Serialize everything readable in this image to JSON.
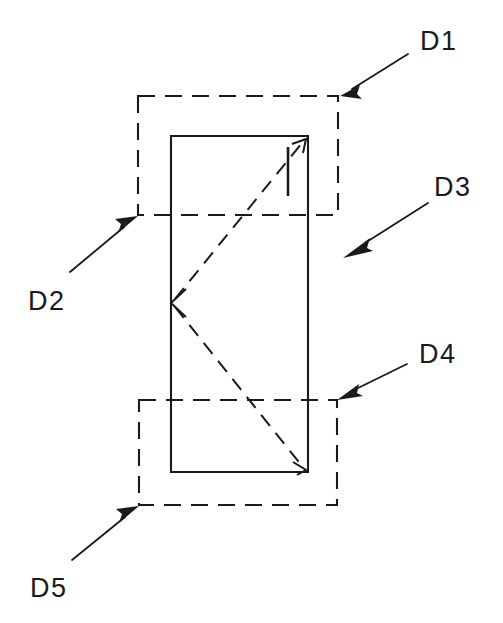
{
  "diagram": {
    "background_color": "#ffffff",
    "line_color": "#1a1a1a",
    "canvas": {
      "width": 503,
      "height": 623
    },
    "labels": [
      {
        "id": "D1",
        "text": "D1",
        "x": 420,
        "y": 50,
        "arrow_tail": {
          "x": 408,
          "y": 54
        },
        "arrow_tip": {
          "x": 340,
          "y": 96
        },
        "points_to": "upper-dashed-rect-top-right-corner"
      },
      {
        "id": "D2",
        "text": "D2",
        "x": 28,
        "y": 310,
        "arrow_tail": {
          "x": 70,
          "y": 272
        },
        "arrow_tip": {
          "x": 138,
          "y": 216
        },
        "points_to": "upper-dashed-rect-bottom-left-corner"
      },
      {
        "id": "D3",
        "text": "D3",
        "x": 434,
        "y": 196,
        "arrow_tail": {
          "x": 428,
          "y": 203
        },
        "arrow_tip": {
          "x": 343,
          "y": 258
        },
        "points_to": "solid-rect-right-side"
      },
      {
        "id": "D4",
        "text": "D4",
        "x": 419,
        "y": 363,
        "arrow_tail": {
          "x": 407,
          "y": 364
        },
        "arrow_tip": {
          "x": 337,
          "y": 400
        },
        "points_to": "lower-dashed-rect-top-right-corner"
      },
      {
        "id": "D5",
        "text": "D5",
        "x": 30,
        "y": 597,
        "arrow_tail": {
          "x": 72,
          "y": 560
        },
        "arrow_tip": {
          "x": 139,
          "y": 506
        },
        "points_to": "lower-dashed-rect-bottom-left-corner"
      }
    ],
    "shapes": {
      "solid_rect": {
        "x1": 171,
        "y1": 136,
        "x2": 308,
        "y2": 472
      },
      "upper_dashed_rect": {
        "x1": 138,
        "y1": 96,
        "x2": 338,
        "y2": 215
      },
      "lower_dashed_rect": {
        "x1": 139,
        "y1": 400,
        "x2": 337,
        "y2": 505
      },
      "diagonal_upper": {
        "x1": 172,
        "y1": 303,
        "x2": 306,
        "y2": 139,
        "arrow_at": "end"
      },
      "diagonal_lower": {
        "x1": 172,
        "y1": 303,
        "x2": 306,
        "y2": 470,
        "arrow_at": "end"
      },
      "vertex_arrow": {
        "x": 172,
        "y": 303,
        "direction": "left"
      },
      "tick_mark": {
        "x1": 288,
        "y1": 147,
        "x2": 288,
        "y2": 196
      }
    }
  }
}
